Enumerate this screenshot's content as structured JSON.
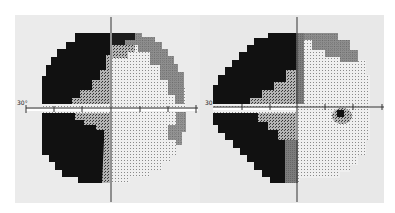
{
  "figure": {
    "left_field": {
      "eccentricity_label": "30°",
      "center": [
        111,
        109
      ],
      "radius": 75
    },
    "right_field": {
      "eccentricity_label": "30°",
      "center": [
        297,
        108
      ],
      "radius": 85
    }
  },
  "colors": {
    "background": "#ebebeb",
    "dense_defect": "#111111",
    "relative_defect": "#7a7a7a",
    "normal": "#e6e6e6",
    "axis": "#333333"
  }
}
